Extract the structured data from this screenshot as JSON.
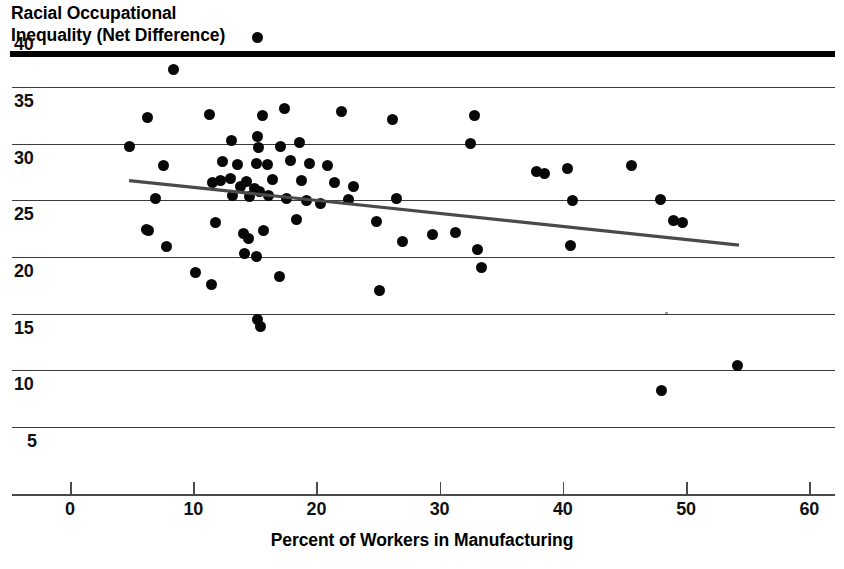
{
  "figure": {
    "background_color": "#ffffff",
    "ink_color": "#000000",
    "grid_color": "#3b3b3b",
    "point_color": "#080808",
    "trendline_color": "#4a4a4a"
  },
  "chart_data": {
    "type": "scatter",
    "title": "",
    "ylabel": "Racial Occupational\nInequality (Net Difference)",
    "xlabel": "Percent of Workers in Manufacturing",
    "xlim": [
      0,
      60
    ],
    "ylim": [
      5,
      40
    ],
    "xticks": [
      0,
      10,
      20,
      30,
      40,
      50,
      60
    ],
    "xticklabels": [
      "0",
      "10",
      "20",
      "30",
      "40",
      "50",
      "60"
    ],
    "yticks": [
      5,
      10,
      15,
      20,
      25,
      30,
      35,
      40
    ],
    "yticklabels": [
      "5",
      "10",
      "15",
      "20",
      "25",
      "30",
      "35",
      "40"
    ],
    "grid": "horizontal",
    "legend": "none",
    "marker": "filled-circle",
    "points": [
      {
        "x": 15.2,
        "y": 40.5
      },
      {
        "x": 8.4,
        "y": 37.7
      },
      {
        "x": 6.3,
        "y": 33.5
      },
      {
        "x": 11.3,
        "y": 33.7
      },
      {
        "x": 15.6,
        "y": 33.6
      },
      {
        "x": 17.4,
        "y": 34.3
      },
      {
        "x": 22.0,
        "y": 34.0
      },
      {
        "x": 26.2,
        "y": 33.3
      },
      {
        "x": 32.8,
        "y": 33.6
      },
      {
        "x": 4.8,
        "y": 30.9
      },
      {
        "x": 13.1,
        "y": 31.4
      },
      {
        "x": 15.2,
        "y": 31.8
      },
      {
        "x": 15.3,
        "y": 30.8
      },
      {
        "x": 17.1,
        "y": 30.9
      },
      {
        "x": 18.6,
        "y": 31.3
      },
      {
        "x": 32.5,
        "y": 31.2
      },
      {
        "x": 7.6,
        "y": 29.2
      },
      {
        "x": 12.4,
        "y": 29.6
      },
      {
        "x": 13.6,
        "y": 29.3
      },
      {
        "x": 15.1,
        "y": 29.4
      },
      {
        "x": 16.0,
        "y": 29.3
      },
      {
        "x": 17.9,
        "y": 29.7
      },
      {
        "x": 19.4,
        "y": 29.4
      },
      {
        "x": 20.9,
        "y": 29.2
      },
      {
        "x": 37.9,
        "y": 28.7
      },
      {
        "x": 38.5,
        "y": 28.5
      },
      {
        "x": 40.4,
        "y": 29.0
      },
      {
        "x": 45.6,
        "y": 29.2
      },
      {
        "x": 11.6,
        "y": 27.7
      },
      {
        "x": 12.2,
        "y": 27.9
      },
      {
        "x": 13.0,
        "y": 28.1
      },
      {
        "x": 13.8,
        "y": 27.4
      },
      {
        "x": 14.3,
        "y": 27.8
      },
      {
        "x": 15.0,
        "y": 27.2
      },
      {
        "x": 16.4,
        "y": 28.0
      },
      {
        "x": 18.8,
        "y": 27.9
      },
      {
        "x": 21.5,
        "y": 27.7
      },
      {
        "x": 23.0,
        "y": 27.4
      },
      {
        "x": 6.9,
        "y": 26.3
      },
      {
        "x": 13.2,
        "y": 26.6
      },
      {
        "x": 14.6,
        "y": 26.5
      },
      {
        "x": 15.4,
        "y": 26.9
      },
      {
        "x": 16.1,
        "y": 26.6
      },
      {
        "x": 17.6,
        "y": 26.3
      },
      {
        "x": 19.2,
        "y": 26.1
      },
      {
        "x": 20.3,
        "y": 25.9
      },
      {
        "x": 22.6,
        "y": 26.2
      },
      {
        "x": 26.5,
        "y": 26.3
      },
      {
        "x": 40.8,
        "y": 26.1
      },
      {
        "x": 47.9,
        "y": 26.2
      },
      {
        "x": 6.2,
        "y": 23.6
      },
      {
        "x": 6.4,
        "y": 23.5
      },
      {
        "x": 11.8,
        "y": 24.2
      },
      {
        "x": 14.1,
        "y": 23.2
      },
      {
        "x": 14.5,
        "y": 22.8
      },
      {
        "x": 15.7,
        "y": 23.5
      },
      {
        "x": 18.4,
        "y": 24.5
      },
      {
        "x": 24.9,
        "y": 24.3
      },
      {
        "x": 29.4,
        "y": 23.1
      },
      {
        "x": 31.3,
        "y": 23.3
      },
      {
        "x": 49.0,
        "y": 24.4
      },
      {
        "x": 49.7,
        "y": 24.2
      },
      {
        "x": 7.8,
        "y": 22.1
      },
      {
        "x": 14.2,
        "y": 21.5
      },
      {
        "x": 15.1,
        "y": 21.2
      },
      {
        "x": 27.0,
        "y": 22.5
      },
      {
        "x": 33.1,
        "y": 21.8
      },
      {
        "x": 40.6,
        "y": 22.2
      },
      {
        "x": 10.2,
        "y": 19.8
      },
      {
        "x": 11.5,
        "y": 18.7
      },
      {
        "x": 17.0,
        "y": 19.4
      },
      {
        "x": 25.1,
        "y": 18.2
      },
      {
        "x": 33.4,
        "y": 20.2
      },
      {
        "x": 15.2,
        "y": 15.6
      },
      {
        "x": 15.5,
        "y": 15.0
      },
      {
        "x": 54.2,
        "y": 11.6
      },
      {
        "x": 48.0,
        "y": 9.4
      }
    ],
    "trendline": {
      "type": "linear-fit",
      "x_start": 4.8,
      "y_start": 27.9,
      "x_end": 54.3,
      "y_end": 22.2,
      "slope": -0.115,
      "direction": "negative"
    },
    "n_points": 77
  }
}
